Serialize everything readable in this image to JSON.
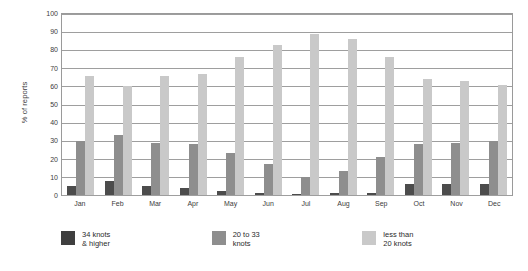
{
  "chart_data": {
    "type": "bar",
    "title": "",
    "xlabel": "",
    "ylabel": "% of reports",
    "ylim": [
      0,
      100
    ],
    "ytick_step": 10,
    "yticks": [
      100,
      90,
      80,
      70,
      60,
      50,
      40,
      30,
      20,
      10,
      0
    ],
    "grid": true,
    "grid_axis": "y",
    "legend_position": "bottom",
    "categories": [
      "Jan",
      "Feb",
      "Mar",
      "Apr",
      "May",
      "Jun",
      "Jul",
      "Aug",
      "Sep",
      "Oct",
      "Nov",
      "Dec"
    ],
    "series": [
      {
        "name": "34 knots\n& higher",
        "color": "#4c4c4c",
        "values": [
          5,
          8,
          5,
          4,
          2,
          1,
          0.5,
          1,
          1,
          6,
          6,
          6
        ]
      },
      {
        "name": "20 to 33\nknots",
        "color": "#8e8e8e",
        "values": [
          30,
          33,
          29,
          28,
          23,
          17,
          10,
          13,
          21,
          28,
          29,
          30
        ]
      },
      {
        "name": "less than\n20 knots",
        "color": "#c9c9c9",
        "values": [
          66,
          60,
          66,
          67,
          76,
          83,
          89,
          86,
          76,
          64,
          63,
          61
        ]
      }
    ]
  },
  "legend": [
    {
      "label": "34 knots\n& higher",
      "swatch": "s0"
    },
    {
      "label": "20 to 33\nknots",
      "swatch": "s1"
    },
    {
      "label": "less than\n20 knots",
      "swatch": "s2"
    }
  ]
}
